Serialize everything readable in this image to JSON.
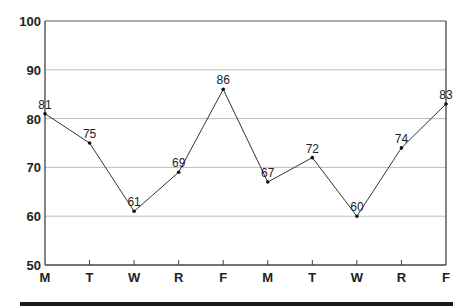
{
  "chart_data": {
    "type": "line",
    "title": "",
    "xlabel": "",
    "ylabel": "",
    "categories": [
      "M",
      "T",
      "W",
      "R",
      "F",
      "M",
      "T",
      "W",
      "R",
      "F"
    ],
    "series": [
      {
        "name": "values",
        "values": [
          81,
          75,
          61,
          69,
          86,
          67,
          72,
          60,
          74,
          83
        ]
      }
    ],
    "ylim": [
      50,
      100
    ],
    "yticks": [
      50,
      60,
      70,
      80,
      90,
      100
    ],
    "grid": true,
    "legend": "none",
    "data_labels": true
  }
}
